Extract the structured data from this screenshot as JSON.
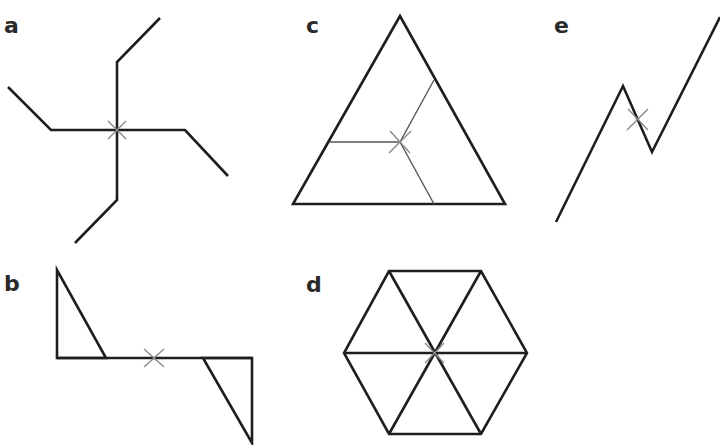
{
  "figure": {
    "colors": {
      "line": "#1e1e1e",
      "thin_line": "#555555",
      "center_mark": "#8a8a8a",
      "background": "#ffffff"
    },
    "panels": [
      {
        "id": "a",
        "label": "a",
        "shape": "four-armed pinwheel (bent arms)",
        "rotational_order": 4
      },
      {
        "id": "b",
        "label": "b",
        "shape": "horizontal bar with two right triangles at opposite ends",
        "rotational_order": 2
      },
      {
        "id": "c",
        "label": "c",
        "shape": "equilateral triangle with three segments from centroid to sides",
        "rotational_order": 3
      },
      {
        "id": "d",
        "label": "d",
        "shape": "regular hexagon divided into six triangles",
        "rotational_order": 6
      },
      {
        "id": "e",
        "label": "e",
        "shape": "zigzag line",
        "rotational_order": 2
      }
    ],
    "center_mark_icon": "x-mark"
  }
}
